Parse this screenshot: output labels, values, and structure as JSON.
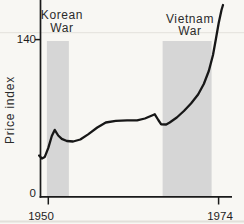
{
  "figure": {
    "ylabel": "Price index",
    "annotations": {
      "korean_war": {
        "line1": "Korean",
        "line2": "War"
      },
      "vietnam_war": {
        "line1": "Vietnam",
        "line2": "War"
      }
    },
    "axis": {
      "y_tick_top": "140",
      "y_tick_bottom": "0",
      "x_tick_left": "1950",
      "x_tick_right": "1974"
    },
    "colors": {
      "background": "#f8f7f3",
      "band": "#d6d6d6",
      "line": "#171717",
      "axis": "#1a1a1a",
      "text": "#2b2b2b"
    }
  },
  "chart_data": {
    "type": "line",
    "title": "",
    "xlabel": "",
    "ylabel": "Price index",
    "x_ticks": [
      1950,
      1974
    ],
    "y_ticks": [
      0,
      140
    ],
    "xlim": [
      1948.6,
      1976
    ],
    "ylim": [
      0,
      175
    ],
    "grid": false,
    "legend": false,
    "bands": [
      {
        "label": "Korean War",
        "year_start": 1949.8,
        "year_end": 1952.9
      },
      {
        "label": "Vietnam War",
        "year_start": 1966.1,
        "year_end": 1973.0
      }
    ],
    "series": [
      {
        "name": "Price index",
        "points": [
          [
            1948.7,
            36.9
          ],
          [
            1949.1,
            34.2
          ],
          [
            1949.5,
            35.6
          ],
          [
            1950.0,
            43.6
          ],
          [
            1950.5,
            54.2
          ],
          [
            1950.9,
            59.6
          ],
          [
            1951.4,
            54.7
          ],
          [
            1951.9,
            51.6
          ],
          [
            1952.6,
            49.8
          ],
          [
            1953.5,
            49.3
          ],
          [
            1954.5,
            51.1
          ],
          [
            1955.6,
            55.6
          ],
          [
            1956.9,
            61.8
          ],
          [
            1958.1,
            66.2
          ],
          [
            1959.5,
            67.7
          ],
          [
            1961.1,
            68.2
          ],
          [
            1962.5,
            68.2
          ],
          [
            1963.6,
            69.8
          ],
          [
            1964.6,
            72.4
          ],
          [
            1965.0,
            73.5
          ],
          [
            1965.5,
            68.4
          ],
          [
            1965.9,
            64.6
          ],
          [
            1966.6,
            64.4
          ],
          [
            1967.1,
            66.2
          ],
          [
            1968.1,
            70.7
          ],
          [
            1969.1,
            76.4
          ],
          [
            1970.1,
            83.1
          ],
          [
            1971.1,
            91.1
          ],
          [
            1971.9,
            100.4
          ],
          [
            1972.6,
            112.0
          ],
          [
            1973.2,
            126.2
          ],
          [
            1973.6,
            140.4
          ],
          [
            1974.0,
            154.7
          ],
          [
            1974.4,
            166.2
          ],
          [
            1974.6,
            170.7
          ]
        ]
      }
    ]
  },
  "render": {
    "x_map": {
      "x_of_1950": 48.3,
      "px_per_year": 7.1
    },
    "y_map": {
      "y_of_0": 197,
      "px_per_unit": 1.125
    },
    "bands_top_px": 41,
    "bands_bottom_px": 197,
    "line_width": 2.3
  }
}
